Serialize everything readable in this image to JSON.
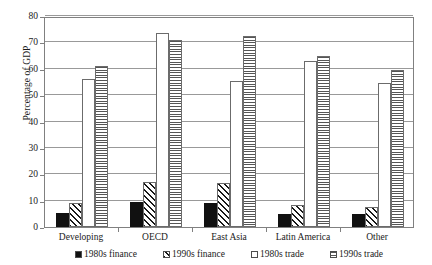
{
  "chart_data": {
    "type": "bar",
    "title": "",
    "xlabel": "",
    "ylabel": "Percentage of GDP",
    "ylim": [
      0,
      80
    ],
    "yticks": [
      0,
      10,
      20,
      30,
      40,
      50,
      60,
      70,
      80
    ],
    "ytick_labels": [
      "0",
      "10",
      "20",
      "30",
      "40",
      "50",
      "60",
      "70",
      "80"
    ],
    "grid": true,
    "legend_position": "bottom",
    "categories": [
      "Developing",
      "OECD",
      "East Asia",
      "Latin America",
      "Other"
    ],
    "series": [
      {
        "name": "1980s finance",
        "fill": "solid-black",
        "values": [
          5.5,
          9.5,
          9.0,
          5.0,
          5.0
        ]
      },
      {
        "name": "1990s finance",
        "fill": "diagonal-hatch",
        "values": [
          9.0,
          17.0,
          16.5,
          8.5,
          7.5
        ]
      },
      {
        "name": "1980s trade",
        "fill": "white",
        "values": [
          56.0,
          73.5,
          55.5,
          63.0,
          54.5
        ]
      },
      {
        "name": "1990s trade",
        "fill": "horizontal-stripe",
        "values": [
          61.0,
          71.0,
          72.5,
          65.0,
          59.5
        ]
      }
    ]
  },
  "colors": {
    "solid_black": "#111111",
    "hatch_line": "#1a1a1a",
    "stripe_line": "#555555",
    "bar_outline": "#6b6b6b",
    "gridline": "#999999",
    "frame": "#808080",
    "background": "#ffffff"
  }
}
